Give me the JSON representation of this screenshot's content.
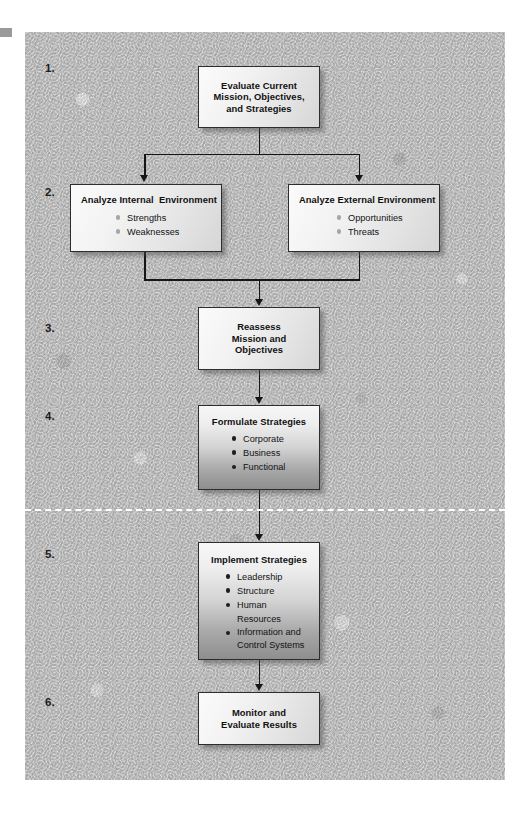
{
  "diagram": {
    "canvas_color": "#c3c3c3",
    "divider_color": "#ffffff",
    "box_border_color": "#2d2d2d",
    "connector_color": "#161616"
  },
  "steps": [
    {
      "number": "1."
    },
    {
      "number": "2."
    },
    {
      "number": "3."
    },
    {
      "number": "4."
    },
    {
      "number": "5."
    },
    {
      "number": "6."
    }
  ],
  "boxes": {
    "evaluate": {
      "title": "Evaluate Current\nMission, Objectives,\nand Strategies",
      "bullets": []
    },
    "internal": {
      "title": "Analyze Internal  Environment",
      "bullets": [
        "Strengths",
        "Weaknesses"
      ]
    },
    "external": {
      "title": "Analyze External Environment",
      "bullets": [
        "Opportunities",
        "Threats"
      ]
    },
    "reassess": {
      "title": "Reassess\nMission and\nObjectives",
      "bullets": []
    },
    "formulate": {
      "title": "Formulate Strategies",
      "bullets": [
        "Corporate",
        "Business",
        "Functional"
      ]
    },
    "implement": {
      "title": "Implement Strategies",
      "bullets": [
        "Leadership",
        "Structure",
        "Human Resources",
        "Information and\nControl Systems"
      ]
    },
    "monitor": {
      "title": "Monitor and\nEvaluate Results",
      "bullets": []
    }
  }
}
